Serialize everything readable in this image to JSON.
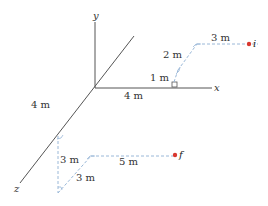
{
  "axes": {
    "x_label": "x",
    "y_label": "y",
    "z_label": "z",
    "axis_color": "#555555"
  },
  "axis_distances": {
    "z_4m": "4 m",
    "x_4m": "4 m"
  },
  "path_initial": {
    "point_label": "i",
    "segments": [
      "1 m",
      "2 m",
      "3 m"
    ],
    "dash_color": "#9ab8d8"
  },
  "path_final": {
    "point_label": "f",
    "segments": [
      "3 m",
      "3 m",
      "5 m"
    ],
    "dash_color": "#9ab8d8"
  },
  "point_color": "#d9382f"
}
